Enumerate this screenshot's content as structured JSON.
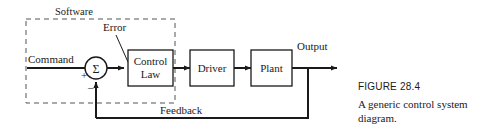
{
  "figure": {
    "caption_title": "FIGURE 28.4",
    "caption_text": "A generic control system diagram.",
    "group_label": "Software"
  },
  "blocks": [
    {
      "id": "control-law",
      "line1": "Control",
      "line2": "Law"
    },
    {
      "id": "driver",
      "line1": "Driver",
      "line2": ""
    },
    {
      "id": "plant",
      "line1": "Plant",
      "line2": ""
    }
  ],
  "junction": {
    "symbol": "Σ",
    "plus_sign": "+",
    "minus_sign": "–"
  },
  "signals": {
    "command": "Command",
    "error": "Error",
    "output": "Output",
    "feedback": "Feedback"
  },
  "colors": {
    "line": "#1a1a1a",
    "dashed_box": "#555555",
    "text": "#1a1a1a",
    "background": "#ffffff"
  }
}
